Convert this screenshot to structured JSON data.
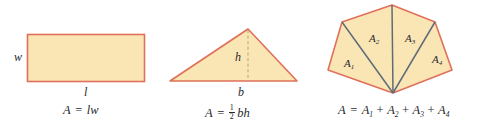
{
  "figure": {
    "colors": {
      "fill": "#fae6b4",
      "stroke": "#e0705a",
      "diagonal": "#5f6b7a",
      "dashed": "#b9a77e",
      "text": "#26292e",
      "background": "#ffffff"
    },
    "panels": [
      {
        "id": "rectangle",
        "shape": "rectangle",
        "dimension_labels": [
          {
            "name": "width-label",
            "text": "w"
          },
          {
            "name": "length-label",
            "text": "l"
          }
        ],
        "formula": {
          "lhs": "A",
          "equals": "=",
          "terms": [
            "l",
            "w"
          ]
        }
      },
      {
        "id": "triangle",
        "shape": "triangle",
        "dimension_labels": [
          {
            "name": "height-label",
            "text": "h"
          },
          {
            "name": "base-label",
            "text": "b"
          }
        ],
        "formula": {
          "lhs": "A",
          "equals": "=",
          "fraction": {
            "numerator": "1",
            "denominator": "2"
          },
          "terms": [
            "b",
            "h"
          ]
        }
      },
      {
        "id": "polygon",
        "shape": "pentagon",
        "region_labels": [
          {
            "name": "region-a1",
            "base": "A",
            "sub": "1"
          },
          {
            "name": "region-a2",
            "base": "A",
            "sub": "2"
          },
          {
            "name": "region-a3",
            "base": "A",
            "sub": "3"
          },
          {
            "name": "region-a4",
            "base": "A",
            "sub": "4"
          }
        ],
        "formula": {
          "lhs": "A",
          "equals": "=",
          "plus": "+",
          "terms": [
            {
              "base": "A",
              "sub": "1"
            },
            {
              "base": "A",
              "sub": "2"
            },
            {
              "base": "A",
              "sub": "3"
            },
            {
              "base": "A",
              "sub": "4"
            }
          ]
        }
      }
    ]
  }
}
